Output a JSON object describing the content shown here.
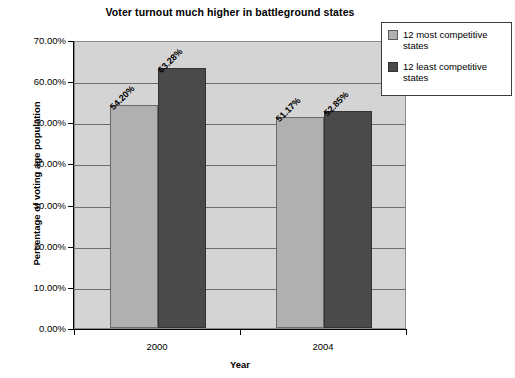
{
  "chart_data": {
    "type": "bar",
    "title": "Voter turnout much higher in battleground states",
    "xlabel": "Year",
    "ylabel": "Percentage of voting age population",
    "categories": [
      "2000",
      "2004"
    ],
    "series": [
      {
        "name": "12 most competitive states",
        "color": "#b0b0b0",
        "values": [
          54.2,
          51.17
        ],
        "labels": [
          "54.20%",
          "51.17%"
        ]
      },
      {
        "name": "12 least competitive states",
        "color": "#4a4a4a",
        "values": [
          63.28,
          52.85
        ],
        "labels": [
          "63.28%",
          "52.85%"
        ]
      }
    ],
    "bars": [
      {
        "category": "2000",
        "series": "12 most competitive states",
        "value": 54.2,
        "label": "54.20%"
      },
      {
        "category": "2000",
        "series": "12 least competitive states",
        "value": 51.17,
        "label": "51.17%"
      },
      {
        "category": "2004",
        "series": "12 most competitive states",
        "value": 63.28,
        "label": "63.28%"
      },
      {
        "category": "2004",
        "series": "12 least competitive states",
        "value": 52.85,
        "label": "52.85%"
      }
    ],
    "ylim": [
      0,
      70
    ],
    "ytick_labels": [
      "70.00%",
      "60.00%",
      "50.00%",
      "40.00%",
      "30.00%",
      "20.00%",
      "10.00%",
      "0.00%"
    ],
    "ytick_values": [
      70,
      60,
      50,
      40,
      30,
      20,
      10,
      0
    ],
    "grid": true,
    "legend_position": "top-right",
    "plot_background": "#d4d4d4"
  },
  "legend": {
    "entries": [
      {
        "label": "12 most competitive states"
      },
      {
        "label": "12 least competitive states"
      }
    ]
  }
}
